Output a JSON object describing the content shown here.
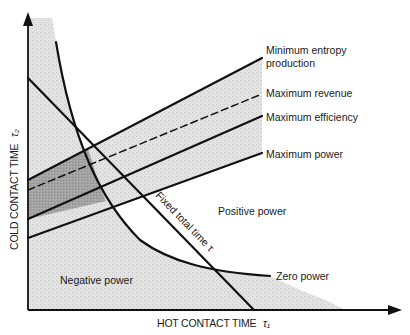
{
  "figure": {
    "x_axis_label": "HOT CONTACT TIME",
    "x_axis_symbol": "τ₁",
    "y_axis_label": "COLD CONTACT TIME",
    "y_axis_symbol": "τ₂",
    "curve_labels": {
      "min_entropy_line1": "Minimum entropy",
      "min_entropy_line2": "production",
      "max_revenue": "Maximum revenue",
      "max_efficiency": "Maximum efficiency",
      "max_power": "Maximum power",
      "zero_power": "Zero power",
      "fixed_total_time": "Fixed total time τ"
    },
    "region_labels": {
      "positive": "Positive power",
      "negative": "Negative power"
    },
    "colors": {
      "line": "#111111",
      "light_shade": "#dcdcdc",
      "band_shade": "#d6d6d6",
      "dark_shade": "#9a9a9a",
      "background": "#ffffff"
    }
  }
}
